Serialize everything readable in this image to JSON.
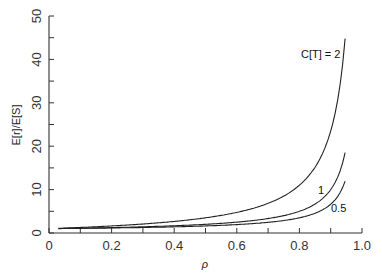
{
  "chart_data": {
    "type": "line",
    "title": "",
    "xlabel": "ρ",
    "ylabel": "E[r]/E[S]",
    "xlim": [
      0,
      1.0
    ],
    "ylim": [
      0,
      50
    ],
    "xticks": [
      0,
      0.2,
      0.4,
      0.6,
      0.8,
      1.0
    ],
    "xtick_labels": [
      "0",
      "0.2",
      "0.4",
      "0.6",
      "0.8",
      "1.0"
    ],
    "xminor_ticks": [
      0.1,
      0.3,
      0.5,
      0.7,
      0.9
    ],
    "yticks": [
      0,
      10,
      20,
      30,
      40,
      50
    ],
    "ytick_labels": [
      "0",
      "10",
      "20",
      "30",
      "40",
      "50"
    ],
    "yminor_ticks": [
      5,
      15,
      25,
      35,
      45
    ],
    "grid": false,
    "legend": "inline labels near curve ends",
    "x": [
      0.03,
      0.1,
      0.2,
      0.3,
      0.4,
      0.5,
      0.6,
      0.7,
      0.75,
      0.8,
      0.85,
      0.88,
      0.9,
      0.92,
      0.94,
      0.947
    ],
    "series": [
      {
        "name": "C[T] = 2",
        "label": "C[T] = 2",
        "values": [
          1.08,
          1.28,
          1.63,
          2.07,
          2.67,
          3.5,
          4.75,
          6.83,
          8.5,
          11.0,
          15.17,
          19.33,
          23.5,
          29.75,
          40.17,
          45.7
        ]
      },
      {
        "name": "C[T] = 1",
        "label": "1",
        "values": [
          1.03,
          1.11,
          1.25,
          1.43,
          1.67,
          2.0,
          2.5,
          3.33,
          4.0,
          5.0,
          6.67,
          8.33,
          10.0,
          12.5,
          16.67,
          18.9
        ]
      },
      {
        "name": "C[T] = 0.5",
        "label": "0.5",
        "values": [
          1.02,
          1.07,
          1.16,
          1.27,
          1.42,
          1.63,
          1.94,
          2.46,
          2.88,
          3.5,
          4.54,
          5.58,
          6.63,
          8.19,
          10.79,
          12.5
        ]
      }
    ]
  }
}
